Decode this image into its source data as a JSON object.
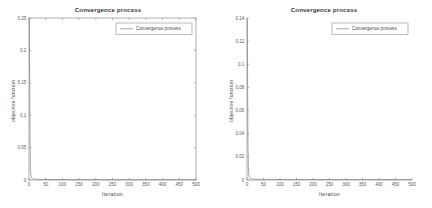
{
  "figure": {
    "background": "#ffffff",
    "axis_color": "#7a7a7a",
    "line_color": "#6f6f6f",
    "text_color": "#4a4a4a"
  },
  "charts": [
    {
      "id": "left",
      "title": "Convergence process",
      "xlabel": "Iteration",
      "ylabel": "objective function",
      "legend": "Convergence process",
      "box": true
    },
    {
      "id": "right",
      "title": "Convergence process",
      "xlabel": "Iteration",
      "ylabel": "objective function",
      "legend": "Convergence process",
      "box": false
    }
  ],
  "chart_data": [
    {
      "type": "line",
      "title": "Convergence process",
      "xlabel": "Iteration",
      "ylabel": "objective function",
      "legend": [
        "Convergence process"
      ],
      "legend_position": "top-right",
      "grid": false,
      "box": true,
      "xlim": [
        0,
        500
      ],
      "ylim": [
        0,
        0.25
      ],
      "xticks": [
        0,
        50,
        100,
        150,
        200,
        250,
        300,
        350,
        400,
        450,
        500
      ],
      "xticklabels": [
        "0",
        "50",
        "100",
        "150",
        "200",
        "250",
        "300",
        "350",
        "400",
        "450",
        "500"
      ],
      "yticks": [
        0,
        0.05,
        0.1,
        0.15,
        0.2,
        0.25
      ],
      "yticklabels": [
        "0",
        "0.05",
        "0.1",
        "0.15",
        "0.2",
        "0.25"
      ],
      "series": [
        {
          "name": "Convergence process",
          "x": [
            0,
            1,
            2,
            3,
            4,
            5,
            6,
            8,
            10,
            14,
            20,
            30,
            50,
            80,
            120,
            180,
            250,
            320,
            400,
            460,
            500
          ],
          "y": [
            0.25,
            0.25,
            0.165,
            0.072,
            0.028,
            0.012,
            0.0065,
            0.0032,
            0.0021,
            0.0014,
            0.0011,
            0.0009,
            0.0008,
            0.0007,
            0.00065,
            0.0006,
            0.00055,
            0.0005,
            0.00048,
            0.00046,
            0.00045
          ]
        }
      ]
    },
    {
      "type": "line",
      "title": "Convergence process",
      "xlabel": "Iteration",
      "ylabel": "objective function",
      "legend": [
        "Convergence process"
      ],
      "legend_position": "top-right",
      "grid": false,
      "box": false,
      "xlim": [
        0,
        500
      ],
      "ylim": [
        0,
        0.14
      ],
      "xticks": [
        0,
        50,
        100,
        150,
        200,
        250,
        300,
        350,
        400,
        450,
        500
      ],
      "xticklabels": [
        "0",
        "50",
        "100",
        "150",
        "200",
        "250",
        "300",
        "350",
        "400",
        "450",
        "500"
      ],
      "yticks": [
        0,
        0.02,
        0.04,
        0.06,
        0.08,
        0.1,
        0.12,
        0.14
      ],
      "yticklabels": [
        "0",
        "0.02",
        "0.04",
        "0.06",
        "0.08",
        "0.1",
        "0.12",
        "0.14"
      ],
      "series": [
        {
          "name": "Convergence process",
          "x": [
            0,
            1,
            2,
            3,
            4,
            5,
            6,
            8,
            10,
            14,
            20,
            30,
            50,
            80,
            120,
            180,
            250,
            320,
            400,
            460,
            500
          ],
          "y": [
            0.14,
            0.138,
            0.072,
            0.031,
            0.013,
            0.0062,
            0.0035,
            0.0019,
            0.0013,
            0.0009,
            0.0007,
            0.0006,
            0.00055,
            0.0005,
            0.00048,
            0.00045,
            0.00043,
            0.00041,
            0.0004,
            0.00039,
            0.00038
          ]
        }
      ]
    }
  ]
}
